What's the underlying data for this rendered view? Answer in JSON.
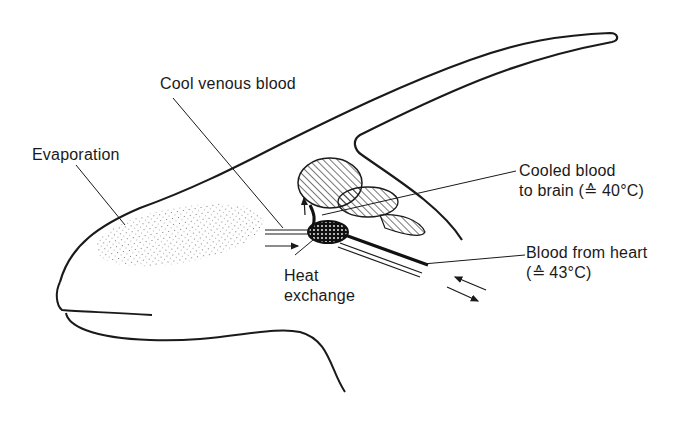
{
  "diagram": {
    "labels": {
      "cool_venous_blood": "Cool venous blood",
      "evaporation": "Evaporation",
      "cooled_blood_line1": "Cooled blood",
      "cooled_blood_line2": "to brain (≙ 40°C)",
      "blood_from_heart_line1": "Blood from heart",
      "blood_from_heart_line2": "(≙ 43°C)",
      "heat_exchange_line1": "Heat",
      "heat_exchange_line2": "exchange"
    },
    "temperatures": {
      "brain_blood_c": 40,
      "heart_blood_c": 43
    },
    "colors": {
      "ink": "#1a1a1a",
      "background": "#ffffff"
    }
  }
}
